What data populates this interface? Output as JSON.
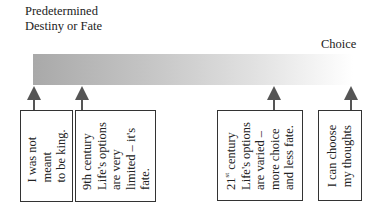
{
  "labels": {
    "left": "Predetermined Destiny or Fate",
    "right": "Choice"
  },
  "gradient_bar": {
    "from_color": "#a9a9a9",
    "to_color": "#ffffff",
    "meaning": "fate-to-choice spectrum"
  },
  "boxes": [
    {
      "text": "I was not\nmeant\nto be king."
    },
    {
      "text": "9th century\nLife's options\nare very\nlimited – it's\nfate."
    },
    {
      "text_prefix": "21",
      "text_sup": "st",
      "text_suffix": " century\nLife's options\nare varied –\nmore choice\nand less fate."
    },
    {
      "text": "I can choose\nmy thoughts"
    }
  ]
}
